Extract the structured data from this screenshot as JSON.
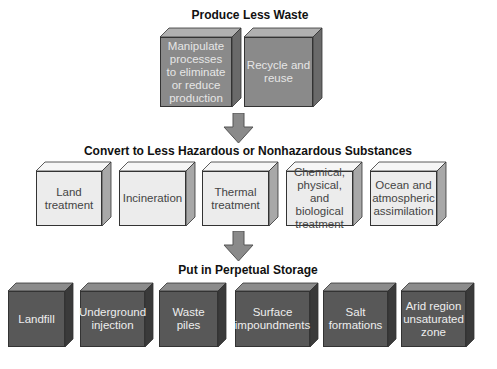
{
  "diagram": {
    "tiers": [
      {
        "heading": "Produce Less Waste",
        "shade": "medium",
        "boxes": [
          {
            "label": "Manipulate processes to eliminate or reduce production",
            "lines": [
              "Manipulate",
              "processes",
              "to eliminate",
              "or reduce",
              "production"
            ]
          },
          {
            "label": "Recycle and reuse",
            "lines": [
              "Recycle and",
              "reuse"
            ]
          }
        ]
      },
      {
        "heading": "Convert to Less Hazardous or Nonhazardous Substances",
        "shade": "light",
        "boxes": [
          {
            "label": "Land treatment",
            "lines": [
              "Land",
              "treatment"
            ]
          },
          {
            "label": "Incineration",
            "lines": [
              "Incineration"
            ]
          },
          {
            "label": "Thermal treatment",
            "lines": [
              "Thermal",
              "treatment"
            ]
          },
          {
            "label": "Chemical, physical, and biological treatment",
            "lines": [
              "Chemical,",
              "physical, and",
              "biological",
              "treatment"
            ]
          },
          {
            "label": "Ocean and atmospheric assimilation",
            "lines": [
              "Ocean and",
              "atmospheric",
              "assimilation"
            ]
          }
        ]
      },
      {
        "heading": "Put in Perpetual Storage",
        "shade": "dark",
        "boxes": [
          {
            "label": "Landfill",
            "lines": [
              "Landfill"
            ]
          },
          {
            "label": "Underground injection",
            "lines": [
              "Underground",
              "injection"
            ]
          },
          {
            "label": "Waste piles",
            "lines": [
              "Waste",
              "piles"
            ]
          },
          {
            "label": "Surface impoundments",
            "lines": [
              "Surface",
              "impoundments"
            ]
          },
          {
            "label": "Salt formations",
            "lines": [
              "Salt",
              "formations"
            ]
          },
          {
            "label": "Arid region unsaturated zone",
            "lines": [
              "Arid region",
              "unsaturated",
              "zone"
            ]
          }
        ]
      }
    ],
    "arrows": [
      {
        "from": "Produce Less Waste",
        "to": "Convert to Less Hazardous or Nonhazardous Substances"
      },
      {
        "from": "Convert to Less Hazardous or Nonhazardous Substances",
        "to": "Put in Perpetual Storage"
      }
    ],
    "colors": {
      "medium_front": "#8a8a8a",
      "medium_top": "#b0b0b0",
      "medium_side": "#6a6a6a",
      "medium_text": "#e6e6e6",
      "light_front": "#ececec",
      "light_top": "#f6f6f6",
      "light_side": "#a8a8a8",
      "light_text": "#444444",
      "dark_front": "#585858",
      "dark_top": "#8c8c8c",
      "dark_side": "#3a3a3a",
      "dark_text": "#eeeeee",
      "arrow": "#8a8a8a"
    }
  }
}
